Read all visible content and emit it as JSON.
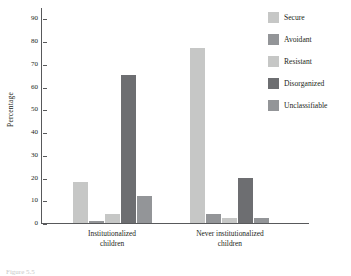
{
  "chart_data": {
    "type": "bar",
    "title": "",
    "xlabel": "",
    "ylabel": "Percentage",
    "ylim": [
      0,
      95
    ],
    "yticks": [
      0,
      10,
      20,
      30,
      40,
      50,
      60,
      70,
      80,
      90
    ],
    "grid": false,
    "legend_position": "top-right",
    "categories": [
      "Institutionalized children",
      "Never institutionalized children"
    ],
    "category_lines": [
      [
        "Institutionalized",
        "children"
      ],
      [
        "Never institutionalized",
        "children"
      ]
    ],
    "series": [
      {
        "name": "Secure",
        "color": "#c6c7c6",
        "values": [
          18,
          77
        ]
      },
      {
        "name": "Avoidant",
        "color": "#939598",
        "values": [
          1,
          4
        ]
      },
      {
        "name": "Resistant",
        "color": "#c6c7c6",
        "values": [
          4,
          2
        ]
      },
      {
        "name": "Disorganized",
        "color": "#6d6e71",
        "values": [
          65,
          20
        ]
      },
      {
        "name": "Unclassifiable",
        "color": "#939598",
        "values": [
          12,
          2
        ]
      }
    ]
  },
  "caption": {
    "text": "Figure 5.5"
  }
}
